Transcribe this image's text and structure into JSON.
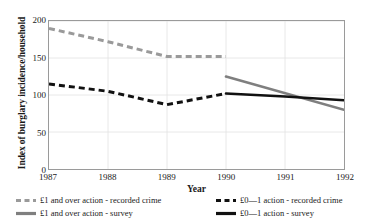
{
  "chart_data": {
    "type": "line",
    "title": "",
    "xlabel": "Year",
    "ylabel": "Index of burglary incidence/household",
    "x": [
      1987,
      1988,
      1989,
      1990,
      1991,
      1992
    ],
    "xticklabels": [
      "1987",
      "1988",
      "1989",
      "1990",
      "1991",
      "1992"
    ],
    "yticklabels": [
      "0",
      "50",
      "100",
      "150",
      "200"
    ],
    "yticks": [
      0,
      50,
      100,
      150,
      200
    ],
    "xlim": [
      1987,
      1992
    ],
    "ylim": [
      0,
      200
    ],
    "grid": true,
    "legend_position": "below",
    "series": [
      {
        "name": "£1 and over action - recorded crime",
        "color": "#9a9a9a",
        "style": "dashed",
        "width": 3,
        "x": [
          1987,
          1988,
          1989,
          1990
        ],
        "values": [
          190,
          172,
          152,
          152
        ]
      },
      {
        "name": "£0—1 action - recorded crime",
        "color": "#111111",
        "style": "dashed",
        "width": 3,
        "x": [
          1987,
          1988,
          1989,
          1990
        ],
        "values": [
          115,
          105,
          87,
          102
        ]
      },
      {
        "name": "£1 and over action - survey",
        "color": "#7f7f7f",
        "style": "solid",
        "width": 2.6,
        "x": [
          1990,
          1992
        ],
        "values": [
          125,
          80
        ]
      },
      {
        "name": "£0—1 action - survey",
        "color": "#111111",
        "style": "solid",
        "width": 2.6,
        "x": [
          1990,
          1991,
          1992
        ],
        "values": [
          102,
          98,
          93
        ]
      }
    ]
  },
  "axes": {
    "ylabel": "Index of burglary incidence/household",
    "xlabel": "Year",
    "yticks": [
      "200",
      "150",
      "100",
      "50",
      "0"
    ],
    "xticks": [
      "1987",
      "1988",
      "1989",
      "1990",
      "1991",
      "1992"
    ]
  },
  "legend": {
    "items": [
      {
        "label": "£1 and over action - recorded crime",
        "color": "#9a9a9a",
        "style": "dashed"
      },
      {
        "label": "£0—1 action - recorded crime",
        "color": "#111111",
        "style": "dashed"
      },
      {
        "label": "£1 and over action - survey",
        "color": "#7f7f7f",
        "style": "solid"
      },
      {
        "label": "£0—1 action - survey",
        "color": "#111111",
        "style": "solid"
      }
    ]
  }
}
